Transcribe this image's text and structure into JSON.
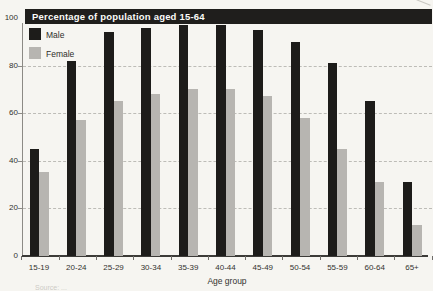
{
  "header": {
    "title": "Percentage of population aged 15-64"
  },
  "legend": {
    "items": [
      {
        "label": "Male",
        "color": "#1d1c1a"
      },
      {
        "label": "Female",
        "color": "#b7b5b1"
      }
    ]
  },
  "axes": {
    "x_title": "Age group"
  },
  "footnote": "Source: ...",
  "chart_data": {
    "type": "bar",
    "title": "Percentage of population aged 15-64",
    "categories": [
      "15-19",
      "20-24",
      "25-29",
      "30-34",
      "35-39",
      "40-44",
      "45-49",
      "50-54",
      "55-59",
      "60-64",
      "65+"
    ],
    "series": [
      {
        "name": "Male",
        "color": "#1d1c1a",
        "values": [
          45,
          82,
          94,
          96,
          97,
          97,
          95,
          90,
          81,
          65,
          31
        ]
      },
      {
        "name": "Female",
        "color": "#b7b5b1",
        "values": [
          35,
          57,
          65,
          68,
          70,
          70,
          67,
          58,
          45,
          31,
          13
        ]
      }
    ],
    "xlabel": "Age group",
    "ylabel": "",
    "ylim": [
      0,
      100
    ],
    "yticks": [
      0,
      20,
      40,
      60,
      80,
      100
    ],
    "gridlines": [
      20,
      40,
      60,
      80
    ],
    "grid_style": "dashed",
    "legend_position": "top-left inside plot"
  }
}
